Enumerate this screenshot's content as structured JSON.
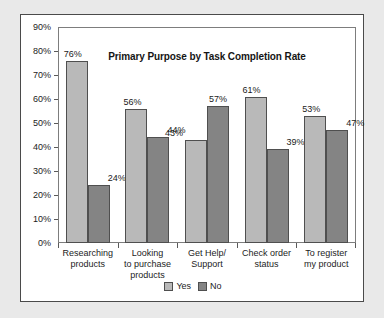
{
  "chart_data": {
    "type": "bar",
    "title": "Primary Purpose by Task Completion Rate",
    "xlabel": "",
    "ylabel": "",
    "ylim": [
      0,
      90
    ],
    "ytick_step": 10,
    "grid": false,
    "legend_position": "bottom-center",
    "categories": [
      "Researching products",
      "Looking to purchase products",
      "Get Help/ Support",
      "Check order status",
      "To register my product"
    ],
    "category_lines": [
      [
        "Researching",
        "products"
      ],
      [
        "Looking",
        "to purchase",
        "products"
      ],
      [
        "Get Help/",
        "Support"
      ],
      [
        "Check order",
        "status"
      ],
      [
        "To register",
        "my product"
      ]
    ],
    "series": [
      {
        "name": "Yes",
        "color": "#b9b9b9",
        "values": [
          76,
          56,
          43,
          61,
          53
        ]
      },
      {
        "name": "No",
        "color": "#848484",
        "values": [
          24,
          44,
          57,
          39,
          47
        ]
      }
    ],
    "value_labels": [
      [
        "76%",
        "24%"
      ],
      [
        "56%",
        "44%"
      ],
      [
        "43%",
        "57%"
      ],
      [
        "61%",
        "39%"
      ],
      [
        "53%",
        "47%"
      ]
    ],
    "ytick_labels": [
      "90%",
      "80%",
      "70%",
      "60%",
      "50%",
      "40%",
      "30%",
      "20%",
      "10%",
      "0%"
    ],
    "ytick_values": [
      90,
      80,
      70,
      60,
      50,
      40,
      30,
      20,
      10,
      0
    ]
  },
  "legend": [
    {
      "label": "Yes"
    },
    {
      "label": "No"
    }
  ],
  "colors": {
    "page_background": "#e9e9e9",
    "panel_background": "#ffffff",
    "panel_border": "#4a4a4a",
    "plot_border": "#7d7d7d",
    "series_yes": "#b9b9b9",
    "series_no": "#848484",
    "bar_outline": "#4f4f4f",
    "text": "#1c1c1c"
  }
}
